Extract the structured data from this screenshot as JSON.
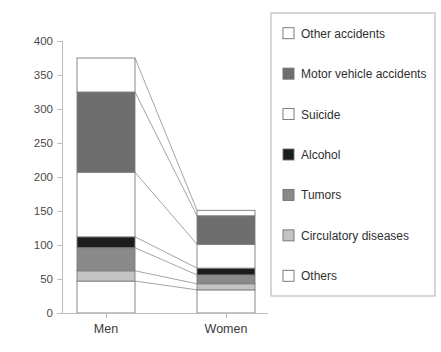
{
  "chart_data": {
    "type": "bar",
    "title": "",
    "xlabel": "",
    "ylabel": "",
    "categories": [
      "Men",
      "Women"
    ],
    "ylim": [
      0,
      400
    ],
    "yticks": [
      0,
      50,
      100,
      150,
      200,
      250,
      300,
      350,
      400
    ],
    "ytick_labels": [
      "0",
      "50",
      "100",
      "150",
      "200",
      "250",
      "300",
      "350",
      "400"
    ],
    "grid": false,
    "stacked": true,
    "legend_position": "right",
    "series": [
      {
        "name": "Others",
        "values": [
          47,
          34
        ],
        "color": "#ffffff"
      },
      {
        "name": "Circulatory diseases",
        "values": [
          15,
          9
        ],
        "color": "#c4c4c4"
      },
      {
        "name": "Tumors",
        "values": [
          34,
          13
        ],
        "color": "#8a8a8a"
      },
      {
        "name": "Alcohol",
        "values": [
          16,
          10
        ],
        "color": "#1c1c1c"
      },
      {
        "name": "Suicide",
        "values": [
          95,
          35
        ],
        "color": "#ffffff"
      },
      {
        "name": "Motor vehicle accidents",
        "values": [
          118,
          42
        ],
        "color": "#6e6e6e"
      },
      {
        "name": "Other accidents",
        "values": [
          50,
          8
        ],
        "color": "#ffffff"
      }
    ],
    "totals": [
      375,
      151
    ],
    "annotations": "Connector lines join matching stack boundaries between the Men and Women bars."
  },
  "legend": {
    "items": [
      {
        "label": "Other accidents",
        "color": "#ffffff"
      },
      {
        "label": "Motor vehicle accidents",
        "color": "#6e6e6e"
      },
      {
        "label": "Suicide",
        "color": "#ffffff"
      },
      {
        "label": "Alcohol",
        "color": "#1c1c1c"
      },
      {
        "label": "Tumors",
        "color": "#8a8a8a"
      },
      {
        "label": "Circulatory diseases",
        "color": "#c4c4c4"
      },
      {
        "label": "Others",
        "color": "#ffffff"
      }
    ]
  }
}
